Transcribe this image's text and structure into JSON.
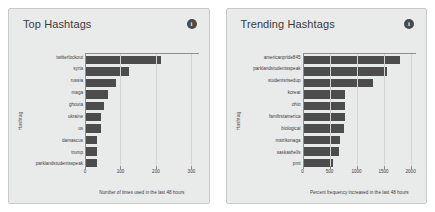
{
  "panels": [
    {
      "title": "Top Hashtags",
      "info_icon": "info-icon",
      "chart": {
        "type": "bar",
        "orientation": "horizontal",
        "title": "Top Hashtags",
        "xlabel": "Number of times used in the last 48 hours",
        "ylabel": "Hashtag",
        "xlim": [
          0,
          320
        ],
        "xticks": [
          0,
          100,
          200,
          300
        ],
        "xtick_labels": [
          "0",
          "100",
          "200",
          "300"
        ],
        "grid": true,
        "legend": "none",
        "categories": [
          "twitterlockout",
          "syria",
          "russia",
          "maga",
          "ghouta",
          "ukraine",
          "us",
          "damascus",
          "trump",
          "parklandstudentsspeak"
        ],
        "values": [
          213,
          123,
          87,
          66,
          54,
          45,
          44,
          34,
          33,
          33
        ]
      }
    },
    {
      "title": "Trending Hashtags",
      "info_icon": "info-icon",
      "chart": {
        "type": "bar",
        "orientation": "horizontal",
        "title": "Trending Hashtags",
        "xlabel": "Percent frequency increased in the last 48 hours",
        "ylabel": "Hashtag",
        "xlim": [
          0,
          2100
        ],
        "xticks": [
          0,
          500,
          1000,
          1500,
          2000
        ],
        "xtick_labels": [
          "0",
          "500",
          "1000",
          "1500",
          "2000"
        ],
        "grid": true,
        "legend": "none",
        "categories": [
          "americanpride845",
          "parklandstudentsspeak",
          "studentsrisedup",
          "koreat",
          "ohio",
          "famfirstamerica",
          "biological",
          "mstrikonaga",
          "saskashells",
          "pmt"
        ],
        "values": [
          1800,
          1560,
          1300,
          780,
          780,
          780,
          770,
          690,
          680,
          560
        ]
      }
    }
  ],
  "chart_data": [
    {
      "type": "bar",
      "orientation": "horizontal",
      "title": "Top Hashtags",
      "xlabel": "Number of times used in the last 48 hours",
      "ylabel": "Hashtag",
      "xlim": [
        0,
        320
      ],
      "ylim": null,
      "xticks": [
        0,
        100,
        200,
        300
      ],
      "grid": true,
      "legend": "none",
      "categories": [
        "twitterlockout",
        "syria",
        "russia",
        "maga",
        "ghouta",
        "ukraine",
        "us",
        "damascus",
        "trump",
        "parklandstudentsspeak"
      ],
      "values": [
        213,
        123,
        87,
        66,
        54,
        45,
        44,
        34,
        33,
        33
      ],
      "bar_color": "#4c4c4c",
      "background": "#e9eaea"
    },
    {
      "type": "bar",
      "orientation": "horizontal",
      "title": "Trending Hashtags",
      "xlabel": "Percent frequency increased in the last 48 hours",
      "ylabel": "Hashtag",
      "xlim": [
        0,
        2100
      ],
      "ylim": null,
      "xticks": [
        0,
        500,
        1000,
        1500,
        2000
      ],
      "grid": true,
      "legend": "none",
      "categories": [
        "americanpride845",
        "parklandstudentsspeak",
        "studentsrisedup",
        "koreat",
        "ohio",
        "famfirstamerica",
        "biological",
        "mstrikonaga",
        "saskashells",
        "pmt"
      ],
      "values": [
        1800,
        1560,
        1300,
        780,
        780,
        780,
        770,
        690,
        680,
        560
      ],
      "bar_color": "#4c4c4c",
      "background": "#e9eaea"
    }
  ]
}
